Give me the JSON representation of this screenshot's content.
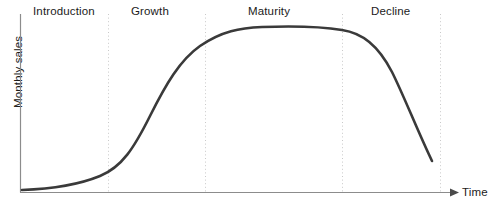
{
  "figure": {
    "title": "",
    "background_color": "#ffffff"
  },
  "axes": {
    "y_label": "Monthly sales",
    "x_label": "Time",
    "axis_color": "#8c8c8c",
    "origin_x": 20,
    "baseline_y": 192,
    "y_axis_top": 14,
    "x_axis_end": 455
  },
  "stages": [
    {
      "name": "introduction",
      "label": "Introduction",
      "label_x": 33,
      "label_y": 8,
      "boundary_x": 108
    },
    {
      "name": "growth",
      "label": "Growth",
      "label_x": 131,
      "label_y": 8,
      "boundary_x": 205
    },
    {
      "name": "maturity",
      "label": "Maturity",
      "label_x": 248,
      "label_y": 8,
      "boundary_x": 342
    },
    {
      "name": "decline",
      "label": "Decline",
      "label_x": 371,
      "label_y": 8,
      "boundary_x": 440
    }
  ],
  "divider_style": {
    "color": "#c9c9c9",
    "dash": "1,2.6",
    "width": 1,
    "top_y": 14,
    "bottom_y": 192
  },
  "curve": {
    "color": "#3a3a3a",
    "width": 2.6,
    "path": "M 22 190 C 50 189 78 185 100 176 C 122 167 134 148 150 116 C 166 84 180 60 200 46 C 222 31 240 28 262 27 C 290 26 318 26 342 30 C 362 33 378 45 392 72 C 404 96 418 132 432 161"
  },
  "chart_data": {
    "type": "line",
    "xlabel": "Time",
    "ylabel": "Monthly sales",
    "grid": false,
    "legend": false,
    "xlim": [
      0,
      100
    ],
    "ylim": [
      0,
      100
    ],
    "annotations": [
      "Introduction",
      "Growth",
      "Maturity",
      "Decline"
    ],
    "stage_boundaries_pct": [
      20,
      42,
      74,
      96
    ],
    "series": [
      {
        "name": "Monthly sales",
        "x": [
          0,
          5,
          10,
          15,
          20,
          25,
          30,
          35,
          40,
          45,
          50,
          55,
          60,
          65,
          70,
          75,
          80,
          85,
          90,
          95
        ],
        "values": [
          1,
          2,
          4,
          6,
          9,
          18,
          32,
          50,
          67,
          80,
          88,
          92,
          93,
          93,
          92,
          89,
          82,
          70,
          52,
          32
        ]
      }
    ]
  }
}
